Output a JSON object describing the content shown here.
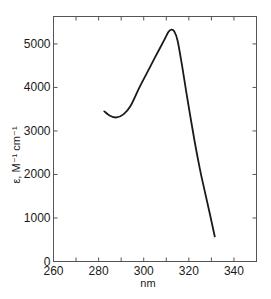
{
  "chart_data": {
    "type": "line",
    "title": "",
    "xlabel": "nm",
    "ylabel": "ε, M⁻¹ cm⁻¹",
    "xlim": [
      260,
      350
    ],
    "ylim": [
      0,
      5630
    ],
    "x_ticks": [
      260,
      270,
      280,
      290,
      300,
      310,
      320,
      330,
      340,
      350
    ],
    "x_tick_labels": [
      "260",
      "",
      "280",
      "",
      "300",
      "",
      "320",
      "",
      "340",
      ""
    ],
    "y_ticks": [
      0,
      1000,
      2000,
      3000,
      4000,
      5000
    ],
    "y_tick_labels": [
      "0",
      "1000",
      "2000",
      "3000",
      "4000",
      "5000"
    ],
    "grid": false,
    "legend": null,
    "series": [
      {
        "name": "absorption spectrum",
        "color": "#1a1a1a",
        "x": [
          282.5,
          285,
          288,
          291,
          294,
          298,
          301.5,
          305,
          309,
          311,
          312.3,
          313.5,
          315,
          317,
          319,
          322.5,
          325,
          327,
          329.5,
          331.5
        ],
        "y": [
          3450,
          3350,
          3310,
          3380,
          3560,
          3990,
          4340,
          4690,
          5080,
          5280,
          5330,
          5290,
          5080,
          4500,
          3850,
          2780,
          2100,
          1630,
          1050,
          575
        ]
      }
    ]
  }
}
